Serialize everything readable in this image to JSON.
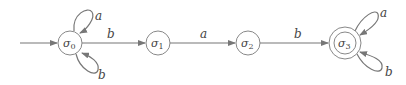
{
  "diagram": {
    "type": "finite-automaton",
    "start_state": "σ0",
    "states": [
      {
        "id": "s0",
        "label": "σ",
        "sub": "0",
        "accepting": false
      },
      {
        "id": "s1",
        "label": "σ",
        "sub": "1",
        "accepting": false
      },
      {
        "id": "s2",
        "label": "σ",
        "sub": "2",
        "accepting": false
      },
      {
        "id": "s3",
        "label": "σ",
        "sub": "3",
        "accepting": true
      }
    ],
    "transitions": [
      {
        "from": "σ0",
        "to": "σ0",
        "label": "a"
      },
      {
        "from": "σ0",
        "to": "σ0",
        "label": "b"
      },
      {
        "from": "σ0",
        "to": "σ1",
        "label": "b"
      },
      {
        "from": "σ1",
        "to": "σ2",
        "label": "a"
      },
      {
        "from": "σ2",
        "to": "σ3",
        "label": "b"
      },
      {
        "from": "σ3",
        "to": "σ3",
        "label": "a"
      },
      {
        "from": "σ3",
        "to": "σ3",
        "label": "b"
      }
    ],
    "colors": {
      "stroke": "#777777",
      "text": "#444444",
      "background": "#ffffff"
    }
  }
}
